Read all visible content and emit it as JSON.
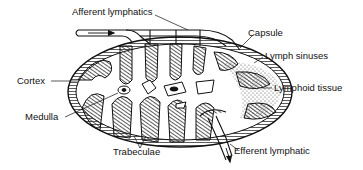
{
  "diagram": {
    "labels": {
      "afferent_lymphatics": "Afferent lymphatics",
      "capsule": "Capsule",
      "lymph_sinuses": "Lymph sinuses",
      "lymphoid_tissue": "Lymphoid tissue",
      "cortex": "Cortex",
      "medulla": "Medulla",
      "trabeculae": "Trabeculae",
      "efferent_lymphatic": "Efferent lymphatic"
    },
    "colors": {
      "ink": "#111111",
      "background": "#ffffff",
      "hatch": "#333333"
    }
  }
}
